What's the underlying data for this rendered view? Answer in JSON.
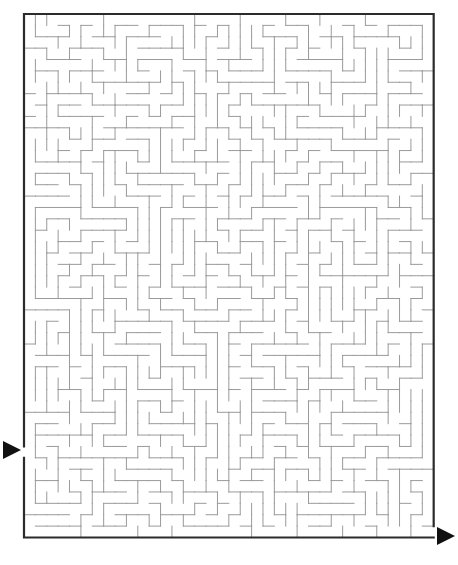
{
  "figure": {
    "title": "Maze Puzzle",
    "type": "rectangular-grid-maze",
    "background_color": "#ffffff"
  },
  "maze": {
    "name": "rectangular-perfect-maze",
    "columns": 36,
    "rows": 46,
    "cell_size_px": 11.38,
    "origin_x_px": 24,
    "origin_y_px": 14,
    "width_px": 410,
    "height_px": 524,
    "border_color": "#2b2b2b",
    "border_width_px": 2.2,
    "wall_color": "#9a9a9a",
    "wall_width_px": 1.0,
    "entrance": {
      "label": "Start",
      "side": "left",
      "row": 38,
      "gap_y_px": 446
    },
    "exit": {
      "label": "Finish",
      "side": "right",
      "row": 45,
      "gap_y_px": 532
    }
  },
  "markers": {
    "start_arrow": {
      "name": "start-arrow",
      "glyph": "right-triangle",
      "color": "#111111",
      "x_px": 3,
      "y_px": 441,
      "size_px": 18
    },
    "finish_arrow": {
      "name": "finish-arrow",
      "glyph": "right-triangle",
      "color": "#111111",
      "x_px": 437,
      "y_px": 527,
      "size_px": 18
    }
  },
  "seed": 20240917
}
